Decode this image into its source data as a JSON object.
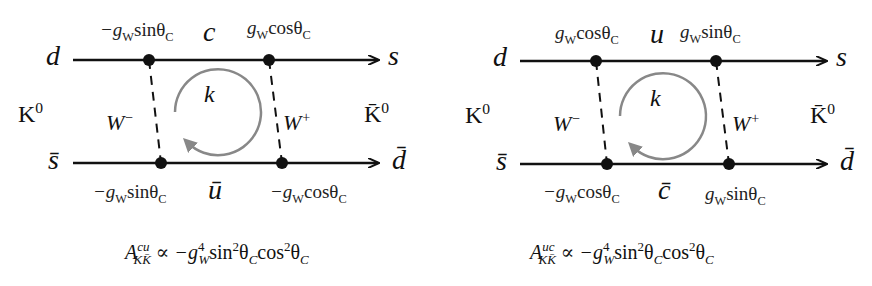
{
  "diagrams": [
    {
      "name": "box-diagram-cu",
      "incoming_top": "d",
      "incoming_bottom": "s̄",
      "outgoing_top": "s",
      "outgoing_bottom": "d̄",
      "initial_meson": "K",
      "initial_meson_sup": "0",
      "final_meson": "K̄",
      "final_meson_sup": "0",
      "top_internal_quark": "c",
      "bottom_internal_quark": "ū",
      "left_boson": "W",
      "left_boson_sup": "−",
      "right_boson": "W",
      "right_boson_sup": "+",
      "loop_momentum": "k",
      "vertex_couplings": {
        "top_left": {
          "prefix": "−g",
          "sub": "W",
          "fn": "sinθ",
          "fn_sub": "C"
        },
        "top_right": {
          "prefix": "g",
          "sub": "W",
          "fn": "cosθ",
          "fn_sub": "C"
        },
        "bottom_left": {
          "prefix": "−g",
          "sub": "W",
          "fn": "sinθ",
          "fn_sub": "C"
        },
        "bottom_right": {
          "prefix": "−g",
          "sub": "W",
          "fn": "cosθ",
          "fn_sub": "C"
        }
      },
      "amplitude": {
        "symbol": "A",
        "sup": "cu",
        "sub": "KK̄",
        "relation": "∝ −g",
        "g_sup": "4",
        "g_sub": "W",
        "rest1": "sin",
        "rest1_sup": "2",
        "theta1": "θ",
        "theta1_sub": "C",
        "rest2": "cos",
        "rest2_sup": "2",
        "theta2": "θ",
        "theta2_sub": "C"
      }
    },
    {
      "name": "box-diagram-uc",
      "incoming_top": "d",
      "incoming_bottom": "s̄",
      "outgoing_top": "s",
      "outgoing_bottom": "d̄",
      "initial_meson": "K",
      "initial_meson_sup": "0",
      "final_meson": "K̄",
      "final_meson_sup": "0",
      "top_internal_quark": "u",
      "bottom_internal_quark": "c̄",
      "left_boson": "W",
      "left_boson_sup": "−",
      "right_boson": "W",
      "right_boson_sup": "+",
      "loop_momentum": "k",
      "vertex_couplings": {
        "top_left": {
          "prefix": "g",
          "sub": "W",
          "fn": "cosθ",
          "fn_sub": "C"
        },
        "top_right": {
          "prefix": "g",
          "sub": "W",
          "fn": "sinθ",
          "fn_sub": "C"
        },
        "bottom_left": {
          "prefix": "−g",
          "sub": "W",
          "fn": "cosθ",
          "fn_sub": "C"
        },
        "bottom_right": {
          "prefix": "g",
          "sub": "W",
          "fn": "sinθ",
          "fn_sub": "C"
        }
      },
      "amplitude": {
        "symbol": "A",
        "sup": "uc",
        "sub": "KK̄",
        "relation": "∝ −g",
        "g_sup": "4",
        "g_sub": "W",
        "rest1": "sin",
        "rest1_sup": "2",
        "theta1": "θ",
        "theta1_sub": "C",
        "rest2": "cos",
        "rest2_sup": "2",
        "theta2": "θ",
        "theta2_sub": "C"
      }
    }
  ],
  "colors": {
    "line": "#111111",
    "loop_arrow": "#888888",
    "text": "#111111"
  }
}
